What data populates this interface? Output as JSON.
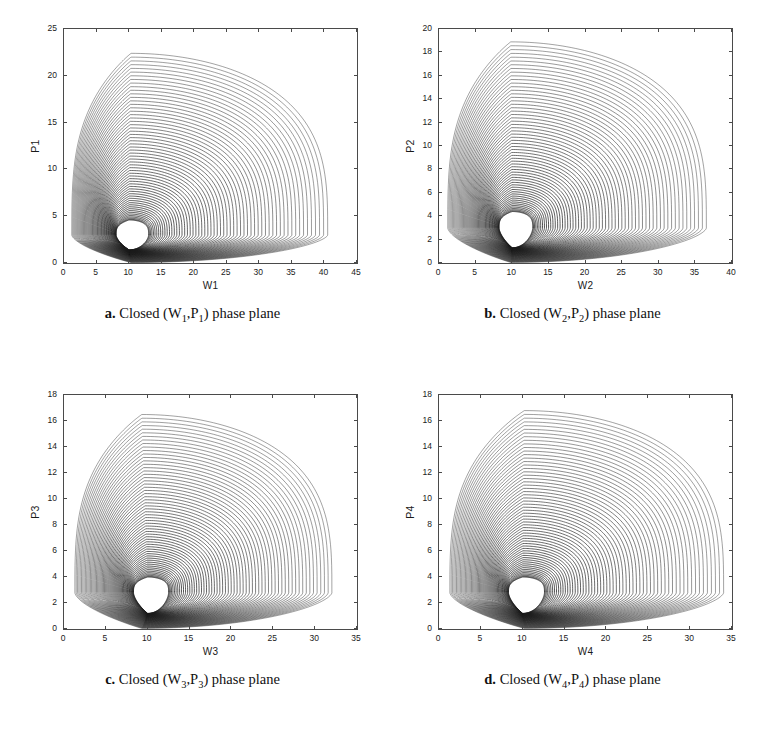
{
  "figure": {
    "kind": "four-panel-phase-plane-figure",
    "background": "#ffffff",
    "ink_color": "#1a1a1a",
    "axis_color": "#4a4a4a"
  },
  "panels": [
    {
      "key": "a",
      "caption_label": "a.",
      "caption_text_pre": "Closed (W",
      "caption_sub1": "1",
      "caption_mid": ",P",
      "caption_sub2": "1",
      "caption_text_post": ") phase plane",
      "caption_plain": "a. Closed (W1,P1) phase plane",
      "xlabel": "W1",
      "ylabel": "P1",
      "xticks": [
        0,
        5,
        10,
        15,
        20,
        25,
        30,
        35,
        40,
        45
      ],
      "yticks": [
        0,
        5,
        10,
        15,
        20,
        25
      ],
      "xlim": [
        0,
        45
      ],
      "ylim": [
        0,
        25
      ]
    },
    {
      "key": "b",
      "caption_label": "b.",
      "caption_text_pre": "Closed (W",
      "caption_sub1": "2",
      "caption_mid": ",P",
      "caption_sub2": "2",
      "caption_text_post": ") phase plane",
      "caption_plain": "b. Closed (W2,P2) phase plane",
      "xlabel": "W2",
      "ylabel": "P2",
      "xticks": [
        0,
        5,
        10,
        15,
        20,
        25,
        30,
        35,
        40
      ],
      "yticks": [
        0,
        2,
        4,
        6,
        8,
        10,
        12,
        14,
        16,
        18,
        20
      ],
      "xlim": [
        0,
        40
      ],
      "ylim": [
        0,
        20
      ]
    },
    {
      "key": "c",
      "caption_label": "c.",
      "caption_text_pre": "Closed (W",
      "caption_sub1": "3",
      "caption_mid": ",P",
      "caption_sub2": "3",
      "caption_text_post": ") phase plane",
      "caption_plain": "c. Closed (W3,P3) phase plane",
      "xlabel": "W3",
      "ylabel": "P3",
      "xticks": [
        0,
        5,
        10,
        15,
        20,
        25,
        30,
        35
      ],
      "yticks": [
        0,
        2,
        4,
        6,
        8,
        10,
        12,
        14,
        16,
        18
      ],
      "xlim": [
        0,
        35
      ],
      "ylim": [
        0,
        18
      ]
    },
    {
      "key": "d",
      "caption_label": "d.",
      "caption_text_pre": "Closed (W",
      "caption_sub1": "4",
      "caption_mid": ",P",
      "caption_sub2": "4",
      "caption_text_post": ") phase plane",
      "caption_plain": "d. Closed (W4,P4) phase plane",
      "xlabel": "W4",
      "ylabel": "P4",
      "xticks": [
        0,
        5,
        10,
        15,
        20,
        25,
        30,
        35
      ],
      "yticks": [
        0,
        2,
        4,
        6,
        8,
        10,
        12,
        14,
        16,
        18
      ],
      "xlim": [
        0,
        35
      ],
      "ylim": [
        0,
        18
      ]
    }
  ],
  "chart_data": [
    {
      "type": "line",
      "panel": "a",
      "title": "a. Closed (W1,P1) phase plane",
      "xlabel": "W1",
      "ylabel": "P1",
      "xlim": [
        0,
        45
      ],
      "ylim": [
        0,
        25
      ],
      "xticks": [
        0,
        5,
        10,
        15,
        20,
        25,
        30,
        35,
        40,
        45
      ],
      "yticks": [
        0,
        5,
        10,
        15,
        20,
        25
      ],
      "grid": false,
      "legend": "none",
      "description": "Family of ~60 nested closed (periodic) Lotka-Volterra-like orbits forming a teardrop cloud; orbits loop counter-clockwise about a common centre.",
      "center": [
        10.0,
        3.0
      ],
      "orbit_count": 60,
      "outermost_orbit": {
        "w_min": 1.2,
        "w_max": 40.5,
        "p_min": 0.05,
        "p_max": 22.4,
        "p_peak_at_w": 10.3
      },
      "innermost_orbit": {
        "w_min": 8.0,
        "w_max": 13.0,
        "p_min": 1.4,
        "p_max": 4.6,
        "p_peak_at_w": 10.0
      },
      "series": [
        {
          "name": "orbit-outer",
          "p_max": 22.4,
          "w_max": 40.5,
          "w_min": 1.2
        },
        {
          "name": "orbit-q3",
          "p_max": 20.0,
          "w_max": 37.5,
          "w_min": 1.5
        },
        {
          "name": "orbit-median",
          "p_max": 15.5,
          "w_max": 30.0,
          "w_min": 2.2
        },
        {
          "name": "orbit-q1",
          "p_max": 10.0,
          "w_max": 22.0,
          "w_min": 3.5
        },
        {
          "name": "orbit-inner",
          "p_max": 4.6,
          "w_max": 13.0,
          "w_min": 8.0
        }
      ]
    },
    {
      "type": "line",
      "panel": "b",
      "title": "b. Closed (W2,P2) phase plane",
      "xlabel": "W2",
      "ylabel": "P2",
      "xlim": [
        0,
        40
      ],
      "ylim": [
        0,
        20
      ],
      "xticks": [
        0,
        5,
        10,
        15,
        20,
        25,
        30,
        35,
        40
      ],
      "yticks": [
        0,
        2,
        4,
        6,
        8,
        10,
        12,
        14,
        16,
        18,
        20
      ],
      "grid": false,
      "legend": "none",
      "description": "Nested closed orbits, peak population near W=10, outermost orbit reaches P=18.9 and W=36.5.",
      "center": [
        10.0,
        3.0
      ],
      "orbit_count": 60,
      "outermost_orbit": {
        "w_min": 1.2,
        "w_max": 36.5,
        "p_min": 0.05,
        "p_max": 18.9,
        "p_peak_at_w": 9.8
      },
      "innermost_orbit": {
        "w_min": 8.2,
        "w_max": 12.8,
        "p_min": 1.3,
        "p_max": 4.4,
        "p_peak_at_w": 10.0
      },
      "series": [
        {
          "name": "orbit-outer",
          "p_max": 18.9,
          "w_max": 36.5,
          "w_min": 1.2
        },
        {
          "name": "orbit-q3",
          "p_max": 17.0,
          "w_max": 33.5,
          "w_min": 1.5
        },
        {
          "name": "orbit-median",
          "p_max": 13.5,
          "w_max": 27.5,
          "w_min": 2.3
        },
        {
          "name": "orbit-q1",
          "p_max": 9.0,
          "w_max": 20.5,
          "w_min": 3.6
        },
        {
          "name": "orbit-inner",
          "p_max": 4.4,
          "w_max": 12.8,
          "w_min": 8.2
        }
      ]
    },
    {
      "type": "line",
      "panel": "c",
      "title": "c. Closed (W3,P3) phase plane",
      "xlabel": "W3",
      "ylabel": "P3",
      "xlim": [
        0,
        35
      ],
      "ylim": [
        0,
        18
      ],
      "xticks": [
        0,
        5,
        10,
        15,
        20,
        25,
        30,
        35
      ],
      "yticks": [
        0,
        2,
        4,
        6,
        8,
        10,
        12,
        14,
        16,
        18
      ],
      "grid": false,
      "legend": "none",
      "description": "Nested closed orbits; outermost reaches P=16.5 at W=9.3 and extends to W=32.",
      "center": [
        10.0,
        2.8
      ],
      "orbit_count": 60,
      "outermost_orbit": {
        "w_min": 1.3,
        "w_max": 32.0,
        "p_min": 0.05,
        "p_max": 16.5,
        "p_peak_at_w": 9.3
      },
      "innermost_orbit": {
        "w_min": 8.3,
        "w_max": 12.5,
        "p_min": 1.2,
        "p_max": 4.0,
        "p_peak_at_w": 10.0
      },
      "series": [
        {
          "name": "orbit-outer",
          "p_max": 16.5,
          "w_max": 32.0,
          "w_min": 1.3
        },
        {
          "name": "orbit-q3",
          "p_max": 14.9,
          "w_max": 29.5,
          "w_min": 1.6
        },
        {
          "name": "orbit-median",
          "p_max": 11.8,
          "w_max": 24.5,
          "w_min": 2.4
        },
        {
          "name": "orbit-q1",
          "p_max": 8.0,
          "w_max": 19.0,
          "w_min": 3.8
        },
        {
          "name": "orbit-inner",
          "p_max": 4.0,
          "w_max": 12.5,
          "w_min": 8.3
        }
      ]
    },
    {
      "type": "line",
      "panel": "d",
      "title": "d. Closed (W4,P4) phase plane",
      "xlabel": "W4",
      "ylabel": "P4",
      "xlim": [
        0,
        35
      ],
      "ylim": [
        0,
        18
      ],
      "xticks": [
        0,
        5,
        10,
        15,
        20,
        25,
        30,
        35
      ],
      "yticks": [
        0,
        2,
        4,
        6,
        8,
        10,
        12,
        14,
        16,
        18
      ],
      "grid": false,
      "legend": "none",
      "description": "Nested closed orbits; outermost reaches P=16.8 at W=10.2 and extends to W=34.",
      "center": [
        10.0,
        2.8
      ],
      "orbit_count": 60,
      "outermost_orbit": {
        "w_min": 1.3,
        "w_max": 34.0,
        "p_min": 0.05,
        "p_max": 16.8,
        "p_peak_at_w": 10.2
      },
      "innermost_orbit": {
        "w_min": 8.3,
        "w_max": 12.6,
        "p_min": 1.2,
        "p_max": 4.0,
        "p_peak_at_w": 10.0
      },
      "series": [
        {
          "name": "orbit-outer",
          "p_max": 16.8,
          "w_max": 34.0,
          "w_min": 1.3
        },
        {
          "name": "orbit-q3",
          "p_max": 15.0,
          "w_max": 31.0,
          "w_min": 1.6
        },
        {
          "name": "orbit-median",
          "p_max": 12.0,
          "w_max": 25.5,
          "w_min": 2.4
        },
        {
          "name": "orbit-q1",
          "p_max": 8.2,
          "w_max": 19.5,
          "w_min": 3.8
        },
        {
          "name": "orbit-inner",
          "p_max": 4.0,
          "w_max": 12.6,
          "w_min": 8.3
        }
      ]
    }
  ]
}
